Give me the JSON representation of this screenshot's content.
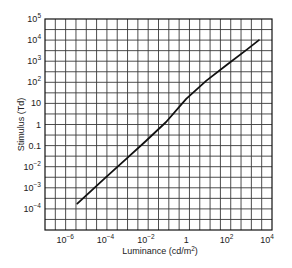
{
  "chart_data": {
    "type": "line",
    "title": "",
    "xlabel": "Luminance (cd/m²)",
    "ylabel": "Stimulus (Td)",
    "xscale": "log",
    "yscale": "log",
    "xlim_log10": [
      -7,
      4.25
    ],
    "ylim_log10": [
      -5,
      5
    ],
    "grid": true,
    "legend": null,
    "x_ticks": [
      {
        "log": -6,
        "base": "10",
        "exp": "−6"
      },
      {
        "log": -4,
        "base": "10",
        "exp": "−4"
      },
      {
        "log": -2,
        "base": "10",
        "exp": "−2"
      },
      {
        "log": 0,
        "base": "1",
        "exp": ""
      },
      {
        "log": 2,
        "base": "10",
        "exp": "2"
      },
      {
        "log": 4,
        "base": "10",
        "exp": "4"
      }
    ],
    "y_ticks": [
      {
        "log": 5,
        "base": "10",
        "exp": "5"
      },
      {
        "log": 4,
        "base": "10",
        "exp": "4"
      },
      {
        "log": 3,
        "base": "10",
        "exp": "3"
      },
      {
        "log": 2,
        "base": "10",
        "exp": "2"
      },
      {
        "log": 1,
        "base": "10",
        "exp": ""
      },
      {
        "log": 0,
        "base": "1",
        "exp": ""
      },
      {
        "log": -1,
        "base": "0.1",
        "exp": ""
      },
      {
        "log": -2,
        "base": "10",
        "exp": "−2"
      },
      {
        "log": -3,
        "base": "10",
        "exp": "−3"
      },
      {
        "log": -4,
        "base": "10",
        "exp": "−4"
      }
    ],
    "series": [
      {
        "name": "Stimulus vs Luminance",
        "color": "#111111",
        "x_log10": [
          -5.4,
          -4.0,
          -3.0,
          -2.0,
          -1.0,
          0.0,
          1.0,
          2.0,
          3.0,
          3.6
        ],
        "y_log10": [
          -3.75,
          -2.52,
          -1.65,
          -0.78,
          0.12,
          1.22,
          2.08,
          2.82,
          3.55,
          4.0
        ]
      }
    ]
  },
  "style": {
    "grid_color": "#3a3a3a",
    "axis_color": "#111111",
    "line_color": "#111111"
  }
}
